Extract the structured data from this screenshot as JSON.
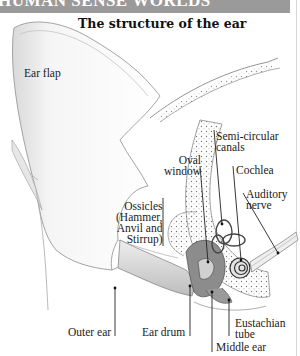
{
  "header": {
    "text": "HUMAN SENSE WORLDS"
  },
  "figure": {
    "title": "The structure of the ear",
    "labels": {
      "ear_flap": "Ear flap",
      "semicircular_canals": "Semi-circular\ncanals",
      "oval_window": "Oval\nwindow",
      "cochlea": "Cochlea",
      "auditory_nerve": "Auditory\nnerve",
      "ossicles": "Ossicles\n(Hammer,\nAnvil and\nStirrup)",
      "outer_ear": "Outer ear",
      "ear_drum": "Ear drum",
      "eustachian_tube": "Eustachian\ntube",
      "middle_ear": "Middle ear"
    }
  }
}
